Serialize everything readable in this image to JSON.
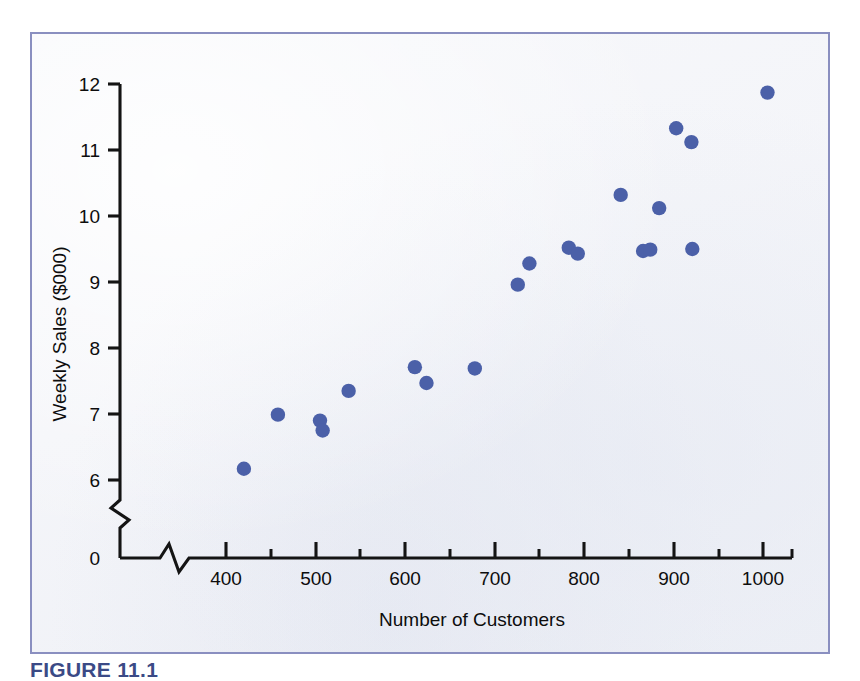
{
  "figure": {
    "caption": "FIGURE 11.1",
    "panel_border_color": "#8a8fc0",
    "point_color": "#4b60a8",
    "axis_color": "#141414"
  },
  "chart_data": {
    "type": "scatter",
    "title": "",
    "xlabel": "Number of Customers",
    "ylabel": "Weekly Sales ($000)",
    "xlim": [
      340,
      1040
    ],
    "ylim": [
      0,
      12
    ],
    "y_axis_break": true,
    "x_axis_break": true,
    "grid": false,
    "legend": "none",
    "x_ticks_major": [
      400,
      500,
      600,
      700,
      800,
      900,
      1000
    ],
    "x_ticks_major_labels": [
      "400",
      "500",
      "600",
      "700",
      "800",
      "900",
      "1000"
    ],
    "x_ticks_minor": [
      450,
      550,
      650,
      750,
      850,
      950
    ],
    "y_ticks_major": [
      0,
      6,
      7,
      8,
      9,
      10,
      11,
      12
    ],
    "y_ticks_major_labels": [
      "0",
      "6",
      "7",
      "8",
      "9",
      "10",
      "11",
      "12"
    ],
    "points": [
      {
        "x": 420,
        "y": 6.17
      },
      {
        "x": 458,
        "y": 6.99
      },
      {
        "x": 505,
        "y": 6.9
      },
      {
        "x": 508,
        "y": 6.75
      },
      {
        "x": 537,
        "y": 7.35
      },
      {
        "x": 611,
        "y": 7.71
      },
      {
        "x": 624,
        "y": 7.47
      },
      {
        "x": 678,
        "y": 7.69
      },
      {
        "x": 726,
        "y": 8.96
      },
      {
        "x": 739,
        "y": 9.28
      },
      {
        "x": 783,
        "y": 9.52
      },
      {
        "x": 793,
        "y": 9.43
      },
      {
        "x": 841,
        "y": 10.32
      },
      {
        "x": 866,
        "y": 9.47
      },
      {
        "x": 874,
        "y": 9.49
      },
      {
        "x": 884,
        "y": 10.12
      },
      {
        "x": 903,
        "y": 11.33
      },
      {
        "x": 920,
        "y": 11.12
      },
      {
        "x": 921,
        "y": 9.5
      },
      {
        "x": 1005,
        "y": 11.87
      }
    ]
  }
}
